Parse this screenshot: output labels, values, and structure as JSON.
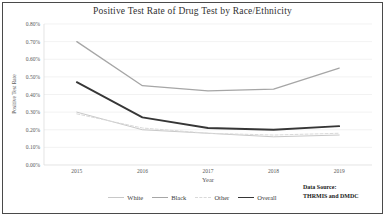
{
  "figure": {
    "data_source_line1": "Data Source:",
    "data_source_line2": "THRMIS and DMDC"
  },
  "chart_data": {
    "type": "line",
    "title": "Positive Test Rate of Drug Test by Race/Ethnicity",
    "xlabel": "Year",
    "ylabel": "Positive Test Rate",
    "categories": [
      "2015",
      "2016",
      "2017",
      "2018",
      "2019"
    ],
    "yticks": [
      "0.00%",
      "0.10%",
      "0.20%",
      "0.30%",
      "0.40%",
      "0.50%",
      "0.60%",
      "0.70%",
      "0.80%"
    ],
    "ylim": [
      0,
      0.8
    ],
    "grid": true,
    "legend_position": "bottom",
    "series": [
      {
        "name": "White",
        "values": [
          0.3,
          0.2,
          0.18,
          0.16,
          0.17
        ],
        "color": "#c8c8c8",
        "dash": "solid",
        "width": 1
      },
      {
        "name": "Black",
        "values": [
          0.7,
          0.45,
          0.42,
          0.43,
          0.55
        ],
        "color": "#a6a6a6",
        "dash": "solid",
        "width": 1.3
      },
      {
        "name": "Other",
        "values": [
          0.29,
          0.21,
          0.18,
          0.17,
          0.18
        ],
        "color": "#d9d9d9",
        "dash": "dashed",
        "width": 1
      },
      {
        "name": "Overall",
        "values": [
          0.47,
          0.27,
          0.21,
          0.2,
          0.22
        ],
        "color": "#363636",
        "dash": "solid",
        "width": 1.8
      }
    ]
  }
}
